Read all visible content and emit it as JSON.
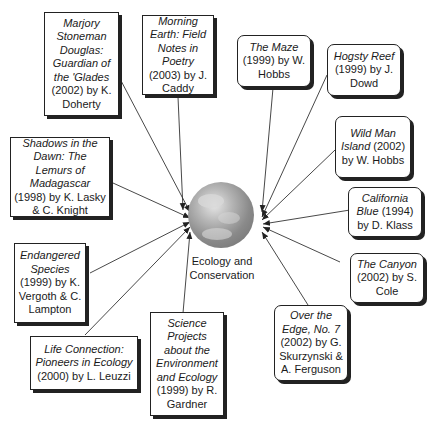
{
  "diagram": {
    "center": {
      "label_line1": "Ecology and",
      "label_line2": "Conservation",
      "icon": "globe-icon"
    },
    "nodes": [
      {
        "id": "n1",
        "title": "Marjory Stoneman Douglas: Guardian of the 'Glades",
        "rest": " (2002) by K. Doherty",
        "shape": "square"
      },
      {
        "id": "n2",
        "title": "Morning Earth: Field Notes in Poetry",
        "rest": " (2003) by J. Caddy",
        "shape": "square"
      },
      {
        "id": "n3",
        "title": "The Maze",
        "rest": " (1999) by W. Hobbs",
        "shape": "rounded"
      },
      {
        "id": "n4",
        "title": "Hogsty Reef",
        "rest": " (1999) by J. Dowd",
        "shape": "rounded"
      },
      {
        "id": "n5",
        "title": "Wild Man Island",
        "rest": " (2002) by W. Hobbs",
        "shape": "rounded"
      },
      {
        "id": "n6",
        "title": "California Blue",
        "rest": " (1994) by D. Klass",
        "shape": "rounded"
      },
      {
        "id": "n7",
        "title": "The Canyon",
        "rest": " (2002) by S. Cole",
        "shape": "rounded"
      },
      {
        "id": "n8",
        "title": "Over the Edge, No. 7",
        "rest": " (2002) by G. Skurzynski & A. Ferguson",
        "shape": "rounded"
      },
      {
        "id": "n9",
        "title": "Science Projects about the Environment and Ecology",
        "rest": " (1999) by R. Gardner",
        "shape": "square"
      },
      {
        "id": "n10",
        "title": "Life Connection: Pioneers in Ecology",
        "rest": " (2000) by L. Leuzzi",
        "shape": "square"
      },
      {
        "id": "n11",
        "title": "Endangered Species",
        "rest": " (1999) by K. Vergoth & C. Lampton",
        "shape": "square"
      },
      {
        "id": "n12",
        "title": "Shadows in the Dawn: The Lemurs of Madagascar",
        "rest": " (1998) by K. Lasky & C. Knight",
        "shape": "square"
      }
    ]
  }
}
